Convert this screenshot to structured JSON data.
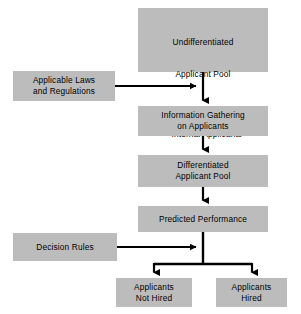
{
  "diagram": {
    "fill_color": "#bcbcbc",
    "line_color": "#000000",
    "background_color": "#ffffff",
    "nodes": {
      "undifferentiated_applicant_pool": {
        "title_line1": "Undifferentiated",
        "title_line2": "Applicant Pool",
        "bullet1": "—Internal Applicants",
        "bullet2": "—External Applicants"
      },
      "applicable_laws": {
        "line1": "Applicable Laws",
        "line2": "and Regulations"
      },
      "information_gathering": {
        "line1": "Information Gathering",
        "line2": "on Applicants"
      },
      "differentiated_applicant_pool": {
        "line1": "Differentiated",
        "line2": "Applicant Pool"
      },
      "predicted_performance": {
        "line1": "Predicted Performance"
      },
      "decision_rules": {
        "line1": "Decision Rules"
      },
      "applicants_not_hired": {
        "line1": "Applicants",
        "line2": "Not Hired"
      },
      "applicants_hired": {
        "line1": "Applicants",
        "line2": "Hired"
      }
    },
    "edges": [
      {
        "from": "undifferentiated_applicant_pool",
        "to": "information_gathering",
        "style": "arrow-down"
      },
      {
        "from": "applicable_laws",
        "to": "undifferentiated_applicant_pool-to-information_gathering",
        "style": "arrow-right"
      },
      {
        "from": "information_gathering",
        "to": "differentiated_applicant_pool",
        "style": "arrow-down"
      },
      {
        "from": "differentiated_applicant_pool",
        "to": "predicted_performance",
        "style": "arrow-down"
      },
      {
        "from": "predicted_performance",
        "to": "decision-junction",
        "style": "line-down"
      },
      {
        "from": "decision_rules",
        "to": "decision-junction",
        "style": "arrow-right"
      },
      {
        "from": "decision-junction",
        "to": "applicants_not_hired",
        "style": "arrow-down-branch-left"
      },
      {
        "from": "decision-junction",
        "to": "applicants_hired",
        "style": "arrow-down-branch-right"
      }
    ]
  }
}
